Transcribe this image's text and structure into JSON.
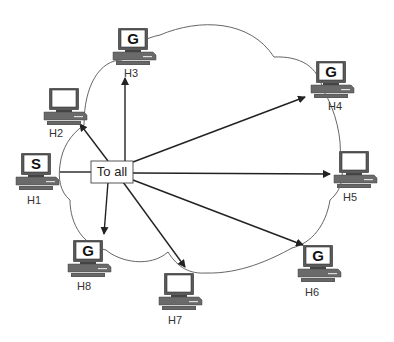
{
  "diagram": {
    "type": "network-broadcast",
    "message_box": {
      "label": "To all",
      "x": 91,
      "y": 160,
      "w": 42,
      "h": 22
    },
    "cloud": {
      "stroke": "#555555"
    },
    "hosts": [
      {
        "id": "H1",
        "label": "H1",
        "screen": "S",
        "x": 36,
        "y": 170,
        "role": "sender"
      },
      {
        "id": "H2",
        "label": "H2",
        "screen": "",
        "x": 64,
        "y": 110,
        "role": "receiver"
      },
      {
        "id": "H3",
        "label": "H3",
        "screen": "G",
        "x": 131,
        "y": 45,
        "role": "group-member"
      },
      {
        "id": "H4",
        "label": "H4",
        "screen": "G",
        "x": 332,
        "y": 78,
        "role": "group-member"
      },
      {
        "id": "H5",
        "label": "H5",
        "screen": "",
        "x": 356,
        "y": 168,
        "role": "receiver"
      },
      {
        "id": "H6",
        "label": "H6",
        "screen": "G",
        "x": 320,
        "y": 263,
        "role": "group-member"
      },
      {
        "id": "H7",
        "label": "H7",
        "screen": "",
        "x": 179,
        "y": 290,
        "role": "receiver"
      },
      {
        "id": "H8",
        "label": "H8",
        "screen": "G",
        "x": 88,
        "y": 256,
        "role": "group-member"
      }
    ],
    "arrows": [
      {
        "from": "To all",
        "to": "H2"
      },
      {
        "from": "To all",
        "to": "H3"
      },
      {
        "from": "To all",
        "to": "H4"
      },
      {
        "from": "To all",
        "to": "H5"
      },
      {
        "from": "To all",
        "to": "H6"
      },
      {
        "from": "To all",
        "to": "H7"
      },
      {
        "from": "To all",
        "to": "H8"
      }
    ],
    "colors": {
      "line": "#222222",
      "monitor": "#5a5a5a",
      "screen": "#ffffff"
    }
  }
}
